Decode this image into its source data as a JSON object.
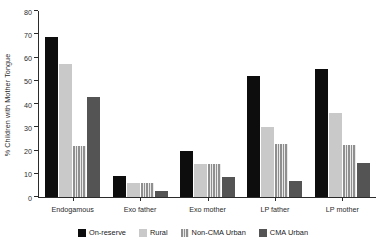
{
  "chart_data": {
    "type": "bar",
    "title": "",
    "xlabel": "",
    "ylabel": "% Children with Mother Tongue",
    "ylim": [
      0,
      80
    ],
    "yticks": [
      0,
      10,
      20,
      30,
      40,
      50,
      60,
      70,
      80
    ],
    "grid": false,
    "legend_position": "bottom",
    "categories": [
      "Endogamous",
      "Exo father",
      "Exo mother",
      "LP father",
      "LP mother"
    ],
    "series": [
      {
        "name": "On-reserve",
        "color": "#0d0d0d",
        "pattern": "solid",
        "values": [
          69,
          9,
          20,
          52,
          55
        ]
      },
      {
        "name": "Rural",
        "color": "#c9c9c9",
        "pattern": "solid",
        "values": [
          57,
          6,
          14,
          30,
          36
        ]
      },
      {
        "name": "Non-CMA Urban",
        "color": "#8f8f8f",
        "pattern": "vertical-stripes",
        "values": [
          22,
          6,
          14,
          23,
          22.5
        ]
      },
      {
        "name": "CMA Urban",
        "color": "#545454",
        "pattern": "solid",
        "values": [
          43,
          2.5,
          8.5,
          7,
          14.5
        ]
      }
    ]
  }
}
